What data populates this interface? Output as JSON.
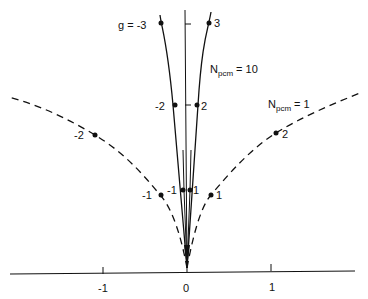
{
  "diagram": {
    "x_axis": {
      "ticks": [
        {
          "value": -1,
          "label": "-1"
        },
        {
          "value": 0,
          "label": "0"
        },
        {
          "value": 1,
          "label": "1"
        }
      ]
    },
    "curves": [
      {
        "name": "N_pcm = 10",
        "label_main": "N",
        "label_sub": "pcm",
        "label_eq": "= 10",
        "style": "solid",
        "points": [
          {
            "g": "-3",
            "label": "g = -3"
          },
          {
            "g": "-2",
            "label": "-2"
          },
          {
            "g": "-1",
            "label": "-1"
          },
          {
            "g": "1",
            "label": "1"
          },
          {
            "g": "2",
            "label": "2"
          },
          {
            "g": "3",
            "label": "3"
          }
        ]
      },
      {
        "name": "N_pcm = 1",
        "label_main": "N",
        "label_sub": "pcm",
        "label_eq": "= 1",
        "style": "dashed",
        "points": [
          {
            "g": "-2",
            "label": "-2"
          },
          {
            "g": "-1",
            "label": "-1"
          },
          {
            "g": "1",
            "label": "1"
          },
          {
            "g": "2",
            "label": "2"
          }
        ]
      }
    ],
    "colors": {
      "ink": "#111111",
      "background": "#ffffff"
    }
  }
}
